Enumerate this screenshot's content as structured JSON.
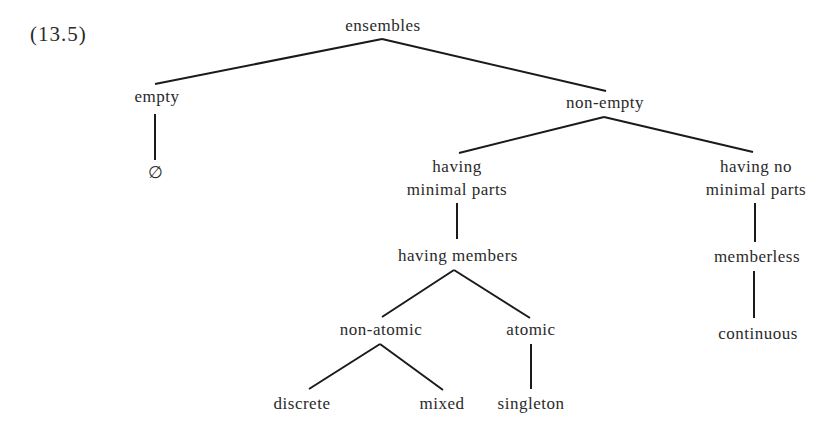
{
  "example_number": "(13.5)",
  "nodes": {
    "root": {
      "label": "ensembles"
    },
    "empty": {
      "label": "empty"
    },
    "empty_symbol": {
      "label": "∅"
    },
    "non_empty": {
      "label": "non-empty"
    },
    "having_minimal_parts": {
      "label_line1": "having",
      "label_line2": "minimal parts"
    },
    "having_no_minimal_parts": {
      "label_line1": "having no",
      "label_line2": "minimal parts"
    },
    "having_members": {
      "label": "having members"
    },
    "memberless": {
      "label": "memberless"
    },
    "non_atomic": {
      "label": "non-atomic"
    },
    "atomic": {
      "label": "atomic"
    },
    "continuous": {
      "label": "continuous"
    },
    "discrete": {
      "label": "discrete"
    },
    "mixed": {
      "label": "mixed"
    },
    "singleton": {
      "label": "singleton"
    }
  },
  "edges": [
    [
      "root",
      "empty"
    ],
    [
      "root",
      "non_empty"
    ],
    [
      "empty",
      "empty_symbol"
    ],
    [
      "non_empty",
      "having_minimal_parts"
    ],
    [
      "non_empty",
      "having_no_minimal_parts"
    ],
    [
      "having_minimal_parts",
      "having_members"
    ],
    [
      "having_no_minimal_parts",
      "memberless"
    ],
    [
      "having_members",
      "non_atomic"
    ],
    [
      "having_members",
      "atomic"
    ],
    [
      "memberless",
      "continuous"
    ],
    [
      "non_atomic",
      "discrete"
    ],
    [
      "non_atomic",
      "mixed"
    ],
    [
      "atomic",
      "singleton"
    ]
  ]
}
